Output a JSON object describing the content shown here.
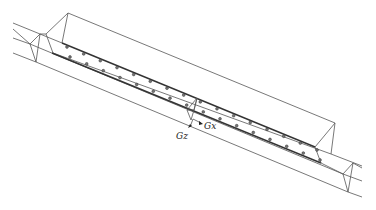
{
  "figure": {
    "type": "isometric-line-drawing",
    "axes": {
      "x_label": "Gx",
      "z_label": "Gz"
    },
    "perforations": {
      "rows": 2,
      "count_per_row": 16
    }
  }
}
